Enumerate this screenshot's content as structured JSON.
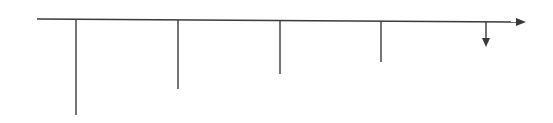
{
  "diagram": {
    "type": "cash-flow-timeline",
    "stroke_color": "#3a3a3a",
    "background": "#ffffff",
    "axis": {
      "x1": 37,
      "y1": 19,
      "x2": 518,
      "y2": 22,
      "arrow_tip_x": 526,
      "arrow_tip_y": 22
    },
    "flows": [
      {
        "x": 76,
        "top": 19,
        "bottom": 115,
        "arrow": false
      },
      {
        "x": 178,
        "top": 20,
        "bottom": 89,
        "arrow": false
      },
      {
        "x": 280,
        "top": 20,
        "bottom": 74,
        "arrow": false
      },
      {
        "x": 381,
        "top": 21,
        "bottom": 62,
        "arrow": false
      },
      {
        "x": 486,
        "top": 22,
        "bottom": 47,
        "arrow": true
      }
    ]
  }
}
